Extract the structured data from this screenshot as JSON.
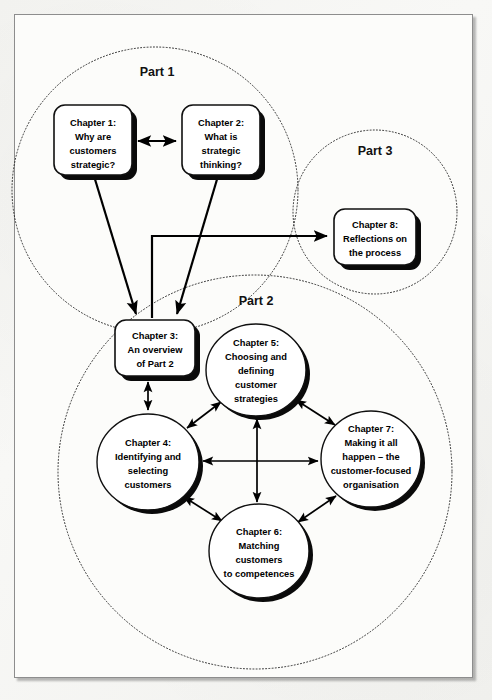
{
  "figure": {
    "background_color": "#f6f6f4",
    "frame_color": "#8d8d8d",
    "ink_color": "#000000"
  },
  "parts": [
    {
      "id": "part1",
      "label": "Part 1",
      "cx": 155,
      "cy": 190,
      "r": 143,
      "label_x": 157,
      "label_y": 76
    },
    {
      "id": "part2",
      "label": "Part 2",
      "cx": 255,
      "cy": 472,
      "r": 197,
      "label_x": 256,
      "label_y": 305
    },
    {
      "id": "part3",
      "label": "Part 3",
      "cx": 375,
      "cy": 212,
      "r": 82,
      "label_x": 375,
      "label_y": 155
    }
  ],
  "nodes": [
    {
      "id": "chapter1",
      "shape": "box",
      "x": 54,
      "y": 105,
      "w": 78,
      "h": 70,
      "rx": 11,
      "lines": [
        "Chapter 1:",
        "Why are",
        "customers",
        "strategic?"
      ]
    },
    {
      "id": "chapter2",
      "shape": "box",
      "x": 182,
      "y": 105,
      "w": 78,
      "h": 70,
      "rx": 11,
      "lines": [
        "Chapter 2:",
        "What is",
        "strategic",
        "thinking?"
      ]
    },
    {
      "id": "chapter8",
      "shape": "box",
      "x": 334,
      "y": 209,
      "w": 82,
      "h": 56,
      "rx": 11,
      "lines": [
        "Chapter 8:",
        "Reflections on",
        "the process"
      ]
    },
    {
      "id": "chapter3",
      "shape": "box",
      "x": 115,
      "y": 320,
      "w": 80,
      "h": 56,
      "rx": 11,
      "lines": [
        "Chapter 3:",
        "An overview",
        "of Part 2"
      ]
    },
    {
      "id": "chapter5",
      "shape": "circle",
      "cx": 256,
      "cy": 370,
      "rx": 50,
      "ry": 46,
      "lines": [
        "Chapter 5:",
        "Choosing and",
        "defining",
        "customer",
        "strategies"
      ]
    },
    {
      "id": "chapter4",
      "shape": "circle",
      "cx": 148,
      "cy": 462,
      "rx": 51,
      "ry": 48,
      "lines": [
        "Chapter 4:",
        "Identifying and",
        "selecting",
        "customers"
      ]
    },
    {
      "id": "chapter7",
      "shape": "circle",
      "cx": 371,
      "cy": 459,
      "rx": 50,
      "ry": 48,
      "lines": [
        "Chapter 7:",
        "Making it all",
        "happen – the",
        "customer-focused",
        "organisation"
      ]
    },
    {
      "id": "chapter6",
      "shape": "circle",
      "cx": 259,
      "cy": 551,
      "rx": 50,
      "ry": 47,
      "lines": [
        "Chapter 6:",
        "Matching",
        "customers",
        "to competences"
      ]
    }
  ],
  "connections": [
    {
      "id": "ch1-ch2",
      "from": "chapter1",
      "to": "chapter2",
      "arrows": "both"
    },
    {
      "id": "ch1-ch3",
      "from": "chapter1",
      "to": "chapter3",
      "arrows": "to"
    },
    {
      "id": "ch2-ch3",
      "from": "chapter2",
      "to": "chapter3",
      "arrows": "to"
    },
    {
      "id": "ch3-ch8",
      "from": "chapter3",
      "to": "chapter8",
      "arrows": "to"
    },
    {
      "id": "ch3-ch4",
      "from": "chapter3",
      "to": "chapter4",
      "arrows": "both"
    },
    {
      "id": "ch4-ch5",
      "from": "chapter4",
      "to": "chapter5",
      "arrows": "both"
    },
    {
      "id": "ch5-ch7",
      "from": "chapter5",
      "to": "chapter7",
      "arrows": "both"
    },
    {
      "id": "ch4-ch6",
      "from": "chapter4",
      "to": "chapter6",
      "arrows": "both"
    },
    {
      "id": "ch6-ch7",
      "from": "chapter6",
      "to": "chapter7",
      "arrows": "both"
    },
    {
      "id": "ch4-ch7",
      "from": "chapter4",
      "to": "chapter7",
      "arrows": "both"
    },
    {
      "id": "ch5-ch6",
      "from": "chapter5",
      "to": "chapter6",
      "arrows": "both"
    }
  ]
}
